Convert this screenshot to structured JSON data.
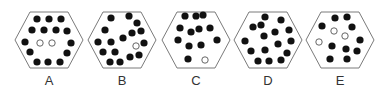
{
  "figure": {
    "colors": {
      "background": "#ffffff",
      "hexagon_stroke": "#7a7a7a",
      "filled_dot": "#111111",
      "hollow_dot_fill": "#ffffff",
      "hollow_dot_stroke": "#555555",
      "label": "#333333"
    },
    "dot_radius": 3.6,
    "options": [
      {
        "label": "A",
        "cx": 49,
        "black_count": 14,
        "white_count": 2,
        "dots": [
          {
            "x": 37,
            "y": 19,
            "fill": "black"
          },
          {
            "x": 49,
            "y": 19,
            "fill": "black"
          },
          {
            "x": 61,
            "y": 19,
            "fill": "black"
          },
          {
            "x": 32,
            "y": 30,
            "fill": "black"
          },
          {
            "x": 44,
            "y": 30,
            "fill": "black"
          },
          {
            "x": 56,
            "y": 30,
            "fill": "black"
          },
          {
            "x": 67,
            "y": 31,
            "fill": "black"
          },
          {
            "x": 25,
            "y": 42,
            "fill": "black"
          },
          {
            "x": 40,
            "y": 43,
            "fill": "white"
          },
          {
            "x": 52,
            "y": 43,
            "fill": "white"
          },
          {
            "x": 71,
            "y": 43,
            "fill": "black"
          },
          {
            "x": 30,
            "y": 52,
            "fill": "black"
          },
          {
            "x": 67,
            "y": 53,
            "fill": "black"
          },
          {
            "x": 37,
            "y": 62,
            "fill": "black"
          },
          {
            "x": 48,
            "y": 62,
            "fill": "black"
          },
          {
            "x": 60,
            "y": 62,
            "fill": "black"
          }
        ]
      },
      {
        "label": "B",
        "cx": 122,
        "black_count": 16,
        "white_count": 1,
        "dots": [
          {
            "x": 111,
            "y": 18,
            "fill": "black"
          },
          {
            "x": 129,
            "y": 16,
            "fill": "black"
          },
          {
            "x": 137,
            "y": 23,
            "fill": "black"
          },
          {
            "x": 105,
            "y": 30,
            "fill": "black"
          },
          {
            "x": 132,
            "y": 33,
            "fill": "black"
          },
          {
            "x": 141,
            "y": 31,
            "fill": "black"
          },
          {
            "x": 123,
            "y": 38,
            "fill": "black"
          },
          {
            "x": 98,
            "y": 42,
            "fill": "black"
          },
          {
            "x": 111,
            "y": 42,
            "fill": "black"
          },
          {
            "x": 136,
            "y": 46,
            "fill": "white"
          },
          {
            "x": 144,
            "y": 43,
            "fill": "black"
          },
          {
            "x": 103,
            "y": 52,
            "fill": "black"
          },
          {
            "x": 115,
            "y": 52,
            "fill": "black"
          },
          {
            "x": 139,
            "y": 55,
            "fill": "black"
          },
          {
            "x": 130,
            "y": 57,
            "fill": "black"
          },
          {
            "x": 110,
            "y": 62,
            "fill": "black"
          },
          {
            "x": 120,
            "y": 62,
            "fill": "black"
          }
        ]
      },
      {
        "label": "C",
        "cx": 196,
        "black_count": 12,
        "white_count": 1,
        "dots": [
          {
            "x": 185,
            "y": 16,
            "fill": "black"
          },
          {
            "x": 196,
            "y": 16,
            "fill": "black"
          },
          {
            "x": 203,
            "y": 15,
            "fill": "black"
          },
          {
            "x": 180,
            "y": 28,
            "fill": "black"
          },
          {
            "x": 191,
            "y": 32,
            "fill": "black"
          },
          {
            "x": 199,
            "y": 29,
            "fill": "black"
          },
          {
            "x": 210,
            "y": 28,
            "fill": "black"
          },
          {
            "x": 178,
            "y": 40,
            "fill": "black"
          },
          {
            "x": 217,
            "y": 40,
            "fill": "black"
          },
          {
            "x": 189,
            "y": 46,
            "fill": "black"
          },
          {
            "x": 201,
            "y": 45,
            "fill": "black"
          },
          {
            "x": 188,
            "y": 59,
            "fill": "black"
          },
          {
            "x": 205,
            "y": 60,
            "fill": "white"
          }
        ]
      },
      {
        "label": "D",
        "cx": 268,
        "black_count": 16,
        "white_count": 0,
        "dots": [
          {
            "x": 265,
            "y": 17,
            "fill": "black"
          },
          {
            "x": 281,
            "y": 20,
            "fill": "black"
          },
          {
            "x": 253,
            "y": 27,
            "fill": "black"
          },
          {
            "x": 261,
            "y": 25,
            "fill": "black"
          },
          {
            "x": 264,
            "y": 36,
            "fill": "black"
          },
          {
            "x": 275,
            "y": 32,
            "fill": "black"
          },
          {
            "x": 289,
            "y": 30,
            "fill": "black"
          },
          {
            "x": 245,
            "y": 41,
            "fill": "black"
          },
          {
            "x": 291,
            "y": 41,
            "fill": "black"
          },
          {
            "x": 278,
            "y": 44,
            "fill": "black"
          },
          {
            "x": 265,
            "y": 50,
            "fill": "black"
          },
          {
            "x": 251,
            "y": 51,
            "fill": "black"
          },
          {
            "x": 287,
            "y": 53,
            "fill": "black"
          },
          {
            "x": 258,
            "y": 61,
            "fill": "black"
          },
          {
            "x": 269,
            "y": 61,
            "fill": "black"
          },
          {
            "x": 281,
            "y": 60,
            "fill": "black"
          }
        ]
      },
      {
        "label": "E",
        "cx": 340,
        "black_count": 10,
        "white_count": 3,
        "dots": [
          {
            "x": 335,
            "y": 18,
            "fill": "black"
          },
          {
            "x": 347,
            "y": 17,
            "fill": "black"
          },
          {
            "x": 322,
            "y": 26,
            "fill": "black"
          },
          {
            "x": 352,
            "y": 27,
            "fill": "black"
          },
          {
            "x": 334,
            "y": 31,
            "fill": "white"
          },
          {
            "x": 345,
            "y": 36,
            "fill": "white"
          },
          {
            "x": 360,
            "y": 40,
            "fill": "black"
          },
          {
            "x": 319,
            "y": 42,
            "fill": "white"
          },
          {
            "x": 332,
            "y": 46,
            "fill": "black"
          },
          {
            "x": 346,
            "y": 49,
            "fill": "black"
          },
          {
            "x": 357,
            "y": 51,
            "fill": "black"
          },
          {
            "x": 330,
            "y": 59,
            "fill": "black"
          },
          {
            "x": 347,
            "y": 59,
            "fill": "black"
          }
        ]
      }
    ]
  }
}
